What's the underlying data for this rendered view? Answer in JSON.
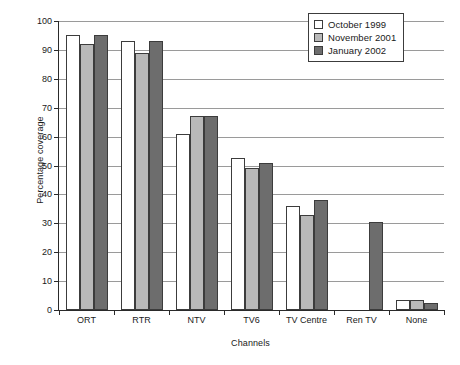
{
  "chart_data": {
    "type": "bar",
    "title": "",
    "xlabel": "Channels",
    "ylabel": "Percentage coverage",
    "categories": [
      "ORT",
      "RTR",
      "NTV",
      "TV6",
      "TV Centre",
      "Ren TV",
      "None"
    ],
    "series": [
      {
        "name": "October 1999",
        "color": "#ffffff",
        "values": [
          95,
          93,
          61,
          52.5,
          36,
          0,
          3.5
        ]
      },
      {
        "name": "November 2001",
        "color": "#b9b9b9",
        "values": [
          92,
          89,
          67,
          49,
          33,
          0,
          3.5
        ]
      },
      {
        "name": "January 2002",
        "color": "#6d6d6d",
        "values": [
          95,
          93,
          67,
          51,
          38,
          30.5,
          2.5
        ]
      }
    ],
    "ylim": [
      0,
      100
    ],
    "yticks": [
      0,
      10,
      20,
      30,
      40,
      50,
      60,
      70,
      80,
      90,
      100
    ],
    "ytick_labels": [
      "0",
      "10",
      "20",
      "30",
      "40",
      "50",
      "60",
      "70",
      "80",
      "90",
      "100"
    ],
    "grid": true,
    "legend_position": "top-right",
    "legend_entries": [
      "October 1999",
      "November 2001",
      "January 2002"
    ]
  }
}
